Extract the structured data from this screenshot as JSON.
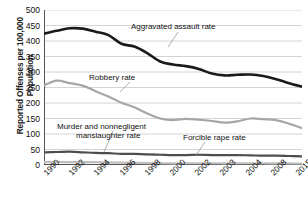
{
  "chart_data": {
    "type": "line",
    "title": "",
    "xlabel": "",
    "ylabel": "Reported Offenses per 100,000 Population",
    "ylim": [
      0,
      500
    ],
    "ytick_labels": [
      "500",
      "450",
      "400",
      "350",
      "300",
      "250",
      "200",
      "150",
      "100",
      "50",
      "0"
    ],
    "ytick_values": [
      500,
      450,
      400,
      350,
      300,
      250,
      200,
      150,
      100,
      50,
      0
    ],
    "xtick_labels": [
      "1990",
      "1992",
      "1994",
      "1996",
      "1998",
      "2000",
      "2002",
      "2003",
      "2004",
      "2008",
      "2015"
    ],
    "x": [
      1990,
      1991,
      1992,
      1993,
      1994,
      1995,
      1996,
      1997,
      1998,
      1999,
      2000,
      2001,
      2002,
      2003,
      2004,
      2005,
      2006,
      2007,
      2008,
      2009,
      2010
    ],
    "grid": true,
    "legend_position": "inline-annotations",
    "series": [
      {
        "name": "Aggravated assault rate",
        "color": "#1a1a1a",
        "values": [
          424,
          433,
          441,
          440,
          430,
          419,
          391,
          382,
          361,
          334,
          324,
          319,
          310,
          295,
          289,
          291,
          292,
          287,
          277,
          264,
          253
        ]
      },
      {
        "name": "Robbery rate",
        "color": "#a6a6a6",
        "values": [
          257,
          272,
          264,
          256,
          238,
          221,
          201,
          186,
          166,
          150,
          145,
          149,
          146,
          142,
          137,
          141,
          150,
          148,
          145,
          133,
          119
        ]
      },
      {
        "name": "Forcible rape rate",
        "color": "#4d4d4d",
        "values": [
          41,
          42,
          43,
          41,
          39,
          38,
          36,
          36,
          34,
          33,
          32,
          32,
          33,
          32,
          32,
          32,
          31,
          30,
          30,
          29,
          28
        ]
      },
      {
        "name": "Murder and nonnegligent manslaughter rate",
        "color": "#bfbfbf",
        "values": [
          9.4,
          9.8,
          9.3,
          9.5,
          9.0,
          8.2,
          7.4,
          6.8,
          6.3,
          5.7,
          5.5,
          5.6,
          5.6,
          5.7,
          5.5,
          5.6,
          5.7,
          5.6,
          5.4,
          5.0,
          4.8
        ]
      }
    ],
    "annotations": [
      {
        "name": "aggravated-assault-label",
        "text": "Aggravated assault rate"
      },
      {
        "name": "robbery-label",
        "text": "Robbery rate"
      },
      {
        "name": "murder-label-line1",
        "text": "Murder and nonnegligent"
      },
      {
        "name": "murder-label-line2",
        "text": "manslaughter rate"
      },
      {
        "name": "forcible-rape-label",
        "text": "Forcible rape rate"
      }
    ]
  },
  "axis": {
    "y_title": "Reported Offenses per 100,000 Population"
  },
  "colors": {
    "aggravated_assault": "#1a1a1a",
    "robbery": "#a6a6a6",
    "forcible_rape": "#4d4d4d",
    "murder": "#bfbfbf",
    "grid": "#c9c9c9",
    "axis": "#555555"
  }
}
